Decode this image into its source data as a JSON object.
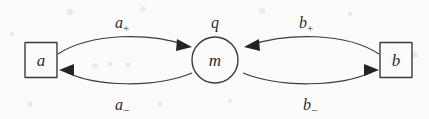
{
  "figure": {
    "type": "state-transition-diagram",
    "background_color": "#fbfbfb",
    "stroke_color": "#3a3a3a",
    "text_color": "#2b2b2b"
  },
  "nodes": [
    {
      "id": "a",
      "label": "a",
      "shape": "square",
      "cx": 41,
      "cy": 60
    },
    {
      "id": "m",
      "label": "m",
      "shape": "circle",
      "cx": 215,
      "cy": 60
    },
    {
      "id": "b",
      "label": "b",
      "shape": "square",
      "cx": 396,
      "cy": 60
    }
  ],
  "edges": [
    {
      "id": "a-plus",
      "base": "a",
      "sub": "+",
      "from": "a",
      "to": "m",
      "position": "upper-left",
      "lx": 122,
      "ly": 22
    },
    {
      "id": "a-minus",
      "base": "a",
      "sub": "−",
      "from": "m",
      "to": "a",
      "position": "lower-left",
      "lx": 122,
      "ly": 106
    },
    {
      "id": "b-plus",
      "base": "b",
      "sub": "+",
      "from": "b",
      "to": "m",
      "position": "upper-right",
      "lx": 306,
      "ly": 22
    },
    {
      "id": "b-minus",
      "base": "b",
      "sub": "−",
      "from": "m",
      "to": "b",
      "position": "lower-right",
      "lx": 310,
      "ly": 106
    }
  ],
  "annotations": [
    {
      "id": "q",
      "label": "q",
      "lx": 215,
      "ly": 22
    }
  ]
}
